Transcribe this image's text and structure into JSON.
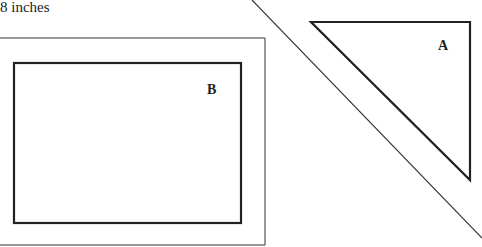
{
  "caption": "8 inches",
  "shapes": {
    "rectangle_label": "B",
    "triangle_label": "A"
  },
  "colors": {
    "stroke": "#222222",
    "background": "#ffffff"
  }
}
